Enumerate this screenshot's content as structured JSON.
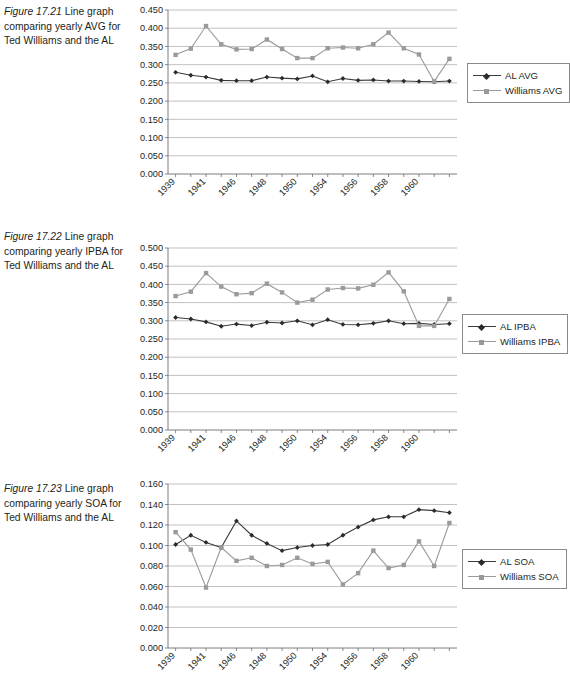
{
  "figures": [
    {
      "id": "fig-17-21",
      "caption_figno": "Figure 17.21",
      "caption_rest": "  Line graph comparing yearly AVG for Ted Williams and the AL",
      "legend": [
        {
          "label": "AL AVG",
          "key": "diamond",
          "color": "#2b2b2b"
        },
        {
          "label": "Williams AVG",
          "key": "square",
          "color": "#9a9a9a"
        }
      ],
      "chart_data": {
        "type": "line",
        "title": "",
        "xlabel": "",
        "ylabel": "",
        "ylim": [
          0.0,
          0.45
        ],
        "ytick_labels": [
          "0.450",
          "0.400",
          "0.350",
          "0.300",
          "0.250",
          "0.200",
          "0.150",
          "0.100",
          "0.050",
          "0.000"
        ],
        "ytick_values": [
          0.45,
          0.4,
          0.35,
          0.3,
          0.25,
          0.2,
          0.15,
          0.1,
          0.05,
          0.0
        ],
        "grid": true,
        "legend_position": "right",
        "x": [
          1939,
          1940,
          1941,
          1942,
          1946,
          1947,
          1948,
          1949,
          1950,
          1951,
          1952,
          1953,
          1954,
          1955,
          1956,
          1957,
          1958,
          1959,
          1960
        ],
        "xtick_labels": [
          "1939",
          "",
          "1941",
          "",
          "1946",
          "",
          "1948",
          "",
          "1950",
          "",
          "1954",
          "",
          "1956",
          "",
          "1958",
          "",
          "1960",
          "",
          ""
        ],
        "xtick_labels_shown": [
          "1939",
          "1941",
          "1946",
          "1948",
          "1950",
          "1954",
          "1956",
          "1958",
          "1960"
        ],
        "series": [
          {
            "name": "AL AVG",
            "values": [
              0.279,
              0.271,
              0.266,
              0.257,
              0.256,
              0.256,
              0.266,
              0.263,
              0.261,
              0.269,
              0.253,
              0.262,
              0.257,
              0.258,
              0.255,
              0.255,
              0.254,
              0.253,
              0.255
            ]
          },
          {
            "name": "Williams AVG",
            "values": [
              0.327,
              0.344,
              0.406,
              0.356,
              0.342,
              0.343,
              0.369,
              0.343,
              0.318,
              0.318,
              0.345,
              0.347,
              0.345,
              0.356,
              0.388,
              0.345,
              0.328,
              0.254,
              0.316
            ]
          }
        ]
      }
    },
    {
      "id": "fig-17-22",
      "caption_figno": "Figure 17.22",
      "caption_rest": "  Line graph comparing yearly IPBA for Ted Williams and the AL",
      "legend": [
        {
          "label": "AL IPBA",
          "key": "diamond",
          "color": "#2b2b2b"
        },
        {
          "label": "Williams IPBA",
          "key": "square",
          "color": "#9a9a9a"
        }
      ],
      "chart_data": {
        "type": "line",
        "title": "",
        "xlabel": "",
        "ylabel": "",
        "ylim": [
          0.0,
          0.5
        ],
        "ytick_labels": [
          "0.500",
          "0.450",
          "0.400",
          "0.350",
          "0.300",
          "0.250",
          "0.200",
          "0.150",
          "0.100",
          "0.050",
          "0.000"
        ],
        "ytick_values": [
          0.5,
          0.45,
          0.4,
          0.35,
          0.3,
          0.25,
          0.2,
          0.15,
          0.1,
          0.05,
          0.0
        ],
        "grid": true,
        "legend_position": "right",
        "x": [
          1939,
          1940,
          1941,
          1942,
          1946,
          1947,
          1948,
          1949,
          1950,
          1951,
          1952,
          1953,
          1954,
          1955,
          1956,
          1957,
          1958,
          1959,
          1960
        ],
        "xtick_labels_shown": [
          "1939",
          "1941",
          "1946",
          "1948",
          "1950",
          "1954",
          "1956",
          "1958",
          "1960"
        ],
        "series": [
          {
            "name": "AL IPBA",
            "values": [
              0.309,
              0.305,
              0.297,
              0.285,
              0.291,
              0.287,
              0.296,
              0.294,
              0.3,
              0.289,
              0.303,
              0.29,
              0.289,
              0.293,
              0.3,
              0.292,
              0.293,
              0.29,
              0.292
            ]
          },
          {
            "name": "Williams IPBA",
            "values": [
              0.368,
              0.38,
              0.431,
              0.394,
              0.373,
              0.376,
              0.402,
              0.378,
              0.35,
              0.358,
              0.386,
              0.39,
              0.389,
              0.399,
              0.433,
              0.381,
              0.286,
              0.286,
              0.36
            ]
          }
        ]
      }
    },
    {
      "id": "fig-17-23",
      "caption_figno": "Figure 17.23",
      "caption_rest": "  Line graph comparing yearly SOA for Ted Williams and the AL",
      "legend": [
        {
          "label": "AL SOA",
          "key": "diamond",
          "color": "#2b2b2b"
        },
        {
          "label": "Williams SOA",
          "key": "square",
          "color": "#9a9a9a"
        }
      ],
      "chart_data": {
        "type": "line",
        "title": "",
        "xlabel": "",
        "ylabel": "",
        "ylim": [
          0.0,
          0.16
        ],
        "ytick_labels": [
          "0.160",
          "0.140",
          "0.120",
          "0.100",
          "0.080",
          "0.060",
          "0.040",
          "0.020",
          "0.000"
        ],
        "ytick_values": [
          0.16,
          0.14,
          0.12,
          0.1,
          0.08,
          0.06,
          0.04,
          0.02,
          0.0
        ],
        "grid": true,
        "legend_position": "right",
        "x": [
          1939,
          1940,
          1941,
          1942,
          1946,
          1947,
          1948,
          1949,
          1950,
          1951,
          1952,
          1953,
          1954,
          1955,
          1956,
          1957,
          1958,
          1959,
          1960
        ],
        "xtick_labels_shown": [
          "1939",
          "1941",
          "1946",
          "1948",
          "1950",
          "1954",
          "1956",
          "1958",
          "1960"
        ],
        "series": [
          {
            "name": "AL SOA",
            "values": [
              0.101,
              0.11,
              0.103,
              0.098,
              0.124,
              0.11,
              0.102,
              0.095,
              0.098,
              0.1,
              0.101,
              0.11,
              0.118,
              0.125,
              0.128,
              0.128,
              0.135,
              0.134,
              0.132
            ]
          },
          {
            "name": "Williams SOA",
            "values": [
              0.113,
              0.096,
              0.059,
              0.098,
              0.085,
              0.088,
              0.08,
              0.081,
              0.088,
              0.082,
              0.084,
              0.062,
              0.073,
              0.095,
              0.078,
              0.081,
              0.104,
              0.08,
              0.122
            ]
          }
        ]
      }
    }
  ]
}
